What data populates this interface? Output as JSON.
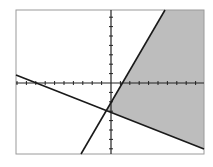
{
  "chart_data": {
    "type": "line",
    "title": "",
    "xlabel": "",
    "ylabel": "",
    "grid": false,
    "tick_marks": true,
    "window": {
      "xmin": -10,
      "xmax": 10,
      "ymin": -8,
      "ymax": 8
    },
    "series": [
      {
        "name": "steep-line",
        "points": [
          [
            -3.2,
            -8
          ],
          [
            6.2,
            8
          ]
        ],
        "style": "solid"
      },
      {
        "name": "shallow-line",
        "points": [
          [
            -10,
            0.6
          ],
          [
            10,
            -7.0
          ]
        ],
        "style": "solid"
      }
    ],
    "shaded_region": {
      "bounded_by": [
        "steep-line",
        "shallow-line"
      ],
      "side": "right-of-steep, above-shallow",
      "color": "#bdbdbd"
    }
  },
  "colors": {
    "frame": "#9a9a9a",
    "axis": "#222222",
    "line": "#1a1a1a",
    "shade": "#bdbdbd",
    "background": "#ffffff"
  }
}
